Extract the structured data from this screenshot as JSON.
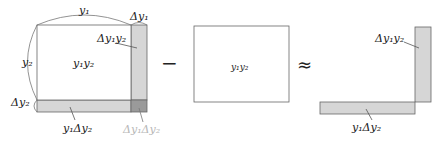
{
  "diagram": {
    "left_figure": {
      "main_rect_label": "y₁y₂",
      "width_label": "y₁",
      "height_label": "y₂",
      "delta_width_label": "Δy₁",
      "delta_height_label": "Δy₂",
      "right_strip_label": "Δy₁y₂",
      "bottom_strip_label": "y₁Δy₂",
      "corner_label": "Δy₁Δy₂"
    },
    "operator_minus": "−",
    "middle_figure": {
      "rect_label": "y₁y₂"
    },
    "operator_approx": "≈",
    "right_figure": {
      "vertical_strip_label": "Δy₁y₂",
      "horizontal_strip_label": "y₁Δy₂"
    },
    "colors": {
      "stroke": "#555555",
      "strip_fill": "#d6d6d6",
      "corner_fill": "#9a9a9a",
      "faded_text": "#b8b8b8",
      "text": "#222222"
    }
  }
}
